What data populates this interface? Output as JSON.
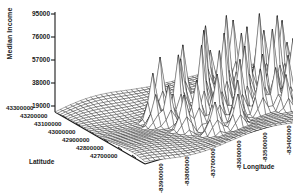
{
  "chart_data": {
    "type": "surface",
    "title": "",
    "subtitle": "",
    "zlabel": "Median Income",
    "xlabel": "Latitude",
    "ylabel": "Longitude",
    "grid": false,
    "legend": "none",
    "projection": "3d-wireframe-mesh",
    "zticks": [
      "95000",
      "76000",
      "57000",
      "38000",
      "19000"
    ],
    "zvalues": [
      95000,
      76000,
      57000,
      38000,
      19000
    ],
    "zlim": [
      19000,
      95000
    ],
    "xticks": [
      "43300000",
      "43200000",
      "43100000",
      "43000000",
      "42900000",
      "42800000",
      "42700000"
    ],
    "xvalues": [
      43300000,
      43200000,
      43100000,
      43000000,
      42900000,
      42800000,
      42700000
    ],
    "xlim": [
      42700000,
      43300000
    ],
    "yticks": [
      "-83900000",
      "-83800000",
      "-83700000",
      "-83600000",
      "-83500000",
      "-83400000"
    ],
    "yvalues": [
      -83900000,
      -83800000,
      -83700000,
      -83600000,
      -83500000,
      -83400000
    ],
    "ylim": [
      -83900000,
      -83400000
    ],
    "surface_description": "Dense wireframe mesh surface of median income over a latitude/longitude grid, flat low plateau around 19000-38000 with numerous tall narrow spikes rising toward 76000-95000 concentrated in the central and right-central region.",
    "mesh_color": "#1a1a1a",
    "face_color": "#ffffff",
    "baseline": 19000,
    "grid_nx": 46,
    "grid_ny": 34,
    "spikes": [
      {
        "gx": 12,
        "gy": 14,
        "h": 0.52
      },
      {
        "gx": 13,
        "gy": 18,
        "h": 0.44
      },
      {
        "gx": 15,
        "gy": 11,
        "h": 0.61
      },
      {
        "gx": 16,
        "gy": 16,
        "h": 0.71
      },
      {
        "gx": 17,
        "gy": 21,
        "h": 0.49
      },
      {
        "gx": 18,
        "gy": 13,
        "h": 0.58
      },
      {
        "gx": 19,
        "gy": 19,
        "h": 0.83
      },
      {
        "gx": 20,
        "gy": 10,
        "h": 0.66
      },
      {
        "gx": 20,
        "gy": 23,
        "h": 0.55
      },
      {
        "gx": 21,
        "gy": 16,
        "h": 0.92
      },
      {
        "gx": 22,
        "gy": 20,
        "h": 0.74
      },
      {
        "gx": 23,
        "gy": 12,
        "h": 0.68
      },
      {
        "gx": 23,
        "gy": 25,
        "h": 0.47
      },
      {
        "gx": 24,
        "gy": 18,
        "h": 0.88
      },
      {
        "gx": 25,
        "gy": 9,
        "h": 0.79
      },
      {
        "gx": 25,
        "gy": 22,
        "h": 0.63
      },
      {
        "gx": 26,
        "gy": 15,
        "h": 1.0
      },
      {
        "gx": 27,
        "gy": 20,
        "h": 0.72
      },
      {
        "gx": 28,
        "gy": 11,
        "h": 0.64
      },
      {
        "gx": 28,
        "gy": 24,
        "h": 0.51
      },
      {
        "gx": 29,
        "gy": 17,
        "h": 0.86
      },
      {
        "gx": 30,
        "gy": 13,
        "h": 0.7
      },
      {
        "gx": 30,
        "gy": 21,
        "h": 0.6
      },
      {
        "gx": 31,
        "gy": 8,
        "h": 0.75
      },
      {
        "gx": 32,
        "gy": 16,
        "h": 0.95
      },
      {
        "gx": 32,
        "gy": 26,
        "h": 0.42
      },
      {
        "gx": 33,
        "gy": 19,
        "h": 0.81
      },
      {
        "gx": 34,
        "gy": 12,
        "h": 0.67
      },
      {
        "gx": 34,
        "gy": 23,
        "h": 0.56
      },
      {
        "gx": 35,
        "gy": 17,
        "h": 0.9
      },
      {
        "gx": 36,
        "gy": 10,
        "h": 0.59
      },
      {
        "gx": 36,
        "gy": 21,
        "h": 0.69
      },
      {
        "gx": 37,
        "gy": 15,
        "h": 0.78
      },
      {
        "gx": 38,
        "gy": 19,
        "h": 0.53
      },
      {
        "gx": 39,
        "gy": 13,
        "h": 0.46
      },
      {
        "gx": 14,
        "gy": 22,
        "h": 0.38
      },
      {
        "gx": 11,
        "gy": 17,
        "h": 0.34
      },
      {
        "gx": 40,
        "gy": 17,
        "h": 0.4
      },
      {
        "gx": 27,
        "gy": 7,
        "h": 0.44
      },
      {
        "gx": 22,
        "gy": 27,
        "h": 0.36
      },
      {
        "gx": 31,
        "gy": 24,
        "h": 0.48
      },
      {
        "gx": 18,
        "gy": 26,
        "h": 0.31
      }
    ]
  },
  "axis": {
    "z_title": "Median Income",
    "x_title": "Latitude",
    "y_title": "Longitude"
  }
}
